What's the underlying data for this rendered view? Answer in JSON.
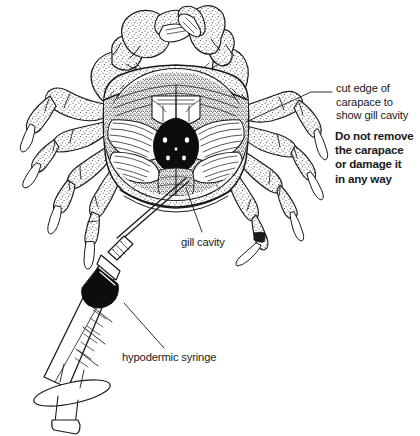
{
  "figure": {
    "background_color": "#ffffff",
    "ink_color": "#1a1a1a"
  },
  "annotations": {
    "cut_edge": {
      "text": "cut edge of\ncarapace to\nshow gill cavity",
      "weight": "regular"
    },
    "warning": {
      "text": "Do not remove\nthe carapace\nor damage it\nin any way",
      "weight": "bold"
    },
    "gill_cavity": {
      "text": "gill cavity",
      "weight": "regular"
    },
    "hypodermic_syringe": {
      "text": "hypodermic syringe",
      "weight": "regular"
    }
  },
  "illustration": {
    "subject": "crab",
    "parts": [
      "carapace",
      "gill cavity",
      "gills",
      "chelipeds",
      "walking legs",
      "hypodermic syringe",
      "needle",
      "barrel",
      "plunger",
      "finger flange"
    ]
  }
}
